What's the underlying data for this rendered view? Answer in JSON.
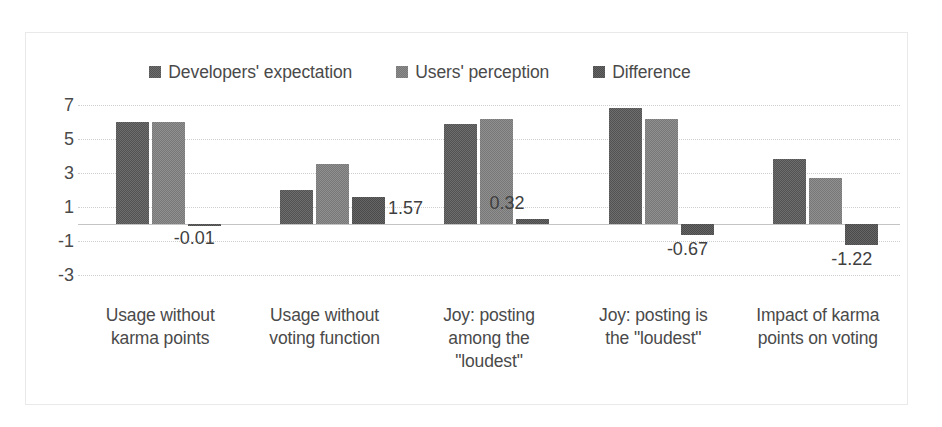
{
  "chart_data": {
    "type": "bar",
    "title": "",
    "subtitle": "",
    "xlabel": "",
    "ylabel": "",
    "ylim": [
      -3,
      7
    ],
    "ytick_step": 2,
    "yticks": [
      "7",
      "5",
      "3",
      "1",
      "-1",
      "-3"
    ],
    "grid": true,
    "legend_position": "top-center",
    "categories": [
      "Usage without karma points",
      "Usage without voting function",
      "Joy: posting among the \"loudest\"",
      "Joy: posting is the \"loudest\"",
      "Impact of karma points on voting"
    ],
    "category_lines": [
      [
        "Usage without",
        "karma points"
      ],
      [
        "Usage without",
        "voting function"
      ],
      [
        "Joy: posting",
        "among the",
        "\"loudest\""
      ],
      [
        "Joy: posting is",
        "the \"loudest\""
      ],
      [
        "Impact of karma",
        "points on voting"
      ]
    ],
    "series": [
      {
        "name": "Developers' expectation",
        "key": "dev",
        "color": "#6e6e6e",
        "values": [
          6.0,
          2.0,
          5.9,
          6.8,
          3.85
        ],
        "labels": [
          "",
          "",
          "",
          "",
          ""
        ]
      },
      {
        "name": "Users' perception",
        "key": "usr",
        "color": "#909090",
        "values": [
          6.0,
          3.55,
          6.2,
          6.2,
          2.68
        ],
        "labels": [
          "",
          "",
          "",
          "",
          ""
        ]
      },
      {
        "name": "Difference",
        "key": "dif",
        "color": "#666666",
        "values": [
          -0.01,
          1.57,
          0.32,
          -0.67,
          -1.22
        ],
        "labels": [
          "-0.01",
          "1.57",
          "0.32",
          "-0.67",
          "-1.22"
        ]
      }
    ]
  },
  "legend": {
    "items": [
      {
        "label": "Developers' expectation",
        "swatch": "legend-swatch-developers"
      },
      {
        "label": "Users' perception",
        "swatch": "legend-swatch-users"
      },
      {
        "label": "Difference",
        "swatch": "legend-swatch-difference"
      }
    ]
  }
}
